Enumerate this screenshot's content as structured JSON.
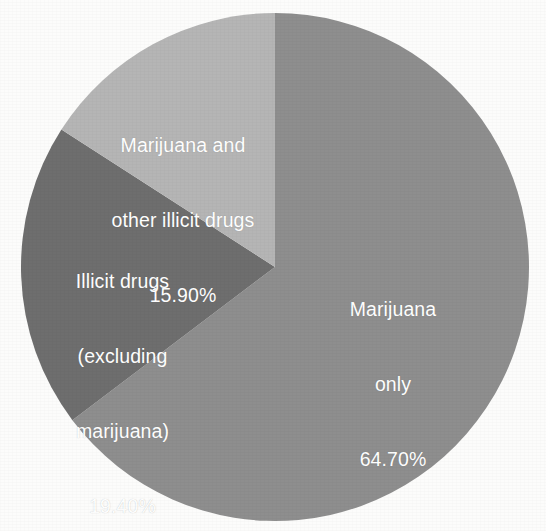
{
  "background_color": "#fcfcfb",
  "label_text_color": "#ffffff",
  "chart_data": {
    "type": "pie",
    "title": "",
    "subtitle": "",
    "xlabel": "",
    "ylabel": "",
    "legend_position": "none",
    "grid": false,
    "labels_inside_slices": true,
    "units": "percent",
    "start_angle_deg": 0,
    "direction": "clockwise",
    "categories": [
      "Marijuana only",
      "Illicit drugs (excluding marijuana)",
      "Marijuana and other illicit drugs"
    ],
    "values": [
      64.7,
      19.4,
      15.9
    ],
    "colors": [
      "#8e8e8e",
      "#6e6e6e",
      "#b5b5b5"
    ],
    "slices": [
      {
        "name": "marijuana-only",
        "label_lines": [
          "Marijuana",
          "only"
        ],
        "value_label": "64.70%",
        "value": 64.7,
        "color": "#8e8e8e",
        "start_angle_deg": 0,
        "end_angle_deg": 232.92
      },
      {
        "name": "illicit-drugs-excluding-marijuana",
        "label_lines": [
          "Illicit drugs",
          "(excluding",
          "marijuana)"
        ],
        "value_label": "19.40%",
        "value": 19.4,
        "color": "#6e6e6e",
        "start_angle_deg": 232.92,
        "end_angle_deg": 302.76
      },
      {
        "name": "marijuana-and-other-illicit-drugs",
        "label_lines": [
          "Marijuana and",
          "other illicit drugs"
        ],
        "value_label": "15.90%",
        "value": 15.9,
        "color": "#b5b5b5",
        "start_angle_deg": 302.76,
        "end_angle_deg": 360
      }
    ]
  },
  "labels": {
    "marijuana_other": {
      "line1": "Marijuana and",
      "line2": "other illicit drugs",
      "percent": "15.90%"
    },
    "illicit_drugs": {
      "line1": "Illicit drugs",
      "line2": "(excluding",
      "line3": "marijuana)",
      "percent": "19.40%"
    },
    "marijuana_only": {
      "line1": "Marijuana",
      "line2": "only",
      "percent": "64.70%"
    }
  }
}
